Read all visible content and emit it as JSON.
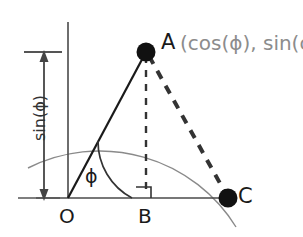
{
  "figure": {
    "kind": "unit-circle-trigonometry-diagram",
    "background_color": "#ffffff",
    "labels": {
      "point_a": "A",
      "point_a_coordinates": "(cos(ϕ), sin(ϕ))",
      "point_o": "O",
      "point_b": "B",
      "point_c": "C",
      "angle": "ϕ",
      "vertical_measure": "sin(ϕ)"
    },
    "colors": {
      "ink": "#1a1a1a",
      "axis": "#4a4a4a",
      "arc": "#8a8a8a",
      "coordinate_text": "#8c8c8c",
      "dash": "#333333",
      "measure": "#444444"
    },
    "geometry": {
      "origin": {
        "x": 68,
        "y": 198
      },
      "radius": 160,
      "point_a": {
        "x": 146,
        "y": 52
      },
      "point_b": {
        "x": 146,
        "y": 198
      },
      "point_c": {
        "x": 228,
        "y": 198
      },
      "angle_degrees": 62,
      "angle_arc_radius": 64,
      "x_axis": {
        "x1": 36,
        "y1": 198,
        "x2": 232,
        "y2": 198
      },
      "y_axis": {
        "x1": 68,
        "y1": 22,
        "x2": 68,
        "y2": 198
      },
      "measure_arrow_x": 44,
      "measure_top_y": 55,
      "measure_bottom_y": 196,
      "tick_top": {
        "x1": 24,
        "y1": 52,
        "x2": 62,
        "y2": 52
      },
      "tick_bottom": {
        "x1": 20,
        "y1": 198,
        "x2": 60,
        "y2": 198
      }
    },
    "elements": {
      "quarter_arc": "circle-arc",
      "radius_line_oa": "solid-line",
      "dashed_height_ab": "thin-dashed-line",
      "dashed_chord_ac": "thick-dashed-line",
      "right_angle_marker_at_b": "square-marker"
    }
  }
}
